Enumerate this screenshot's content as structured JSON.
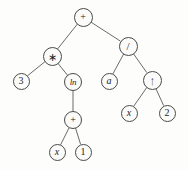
{
  "figure": {
    "kind": "expression-tree",
    "expression": "3 * ln(x + 1) + a / x ^ 2",
    "width": 188,
    "height": 170,
    "background_color": "#fdfdfc",
    "node_stroke_color": "#4a4a4a",
    "node_fill_color": "#fbfbfa",
    "edge_color": "#5a5a5a",
    "text_color": "#1d1d1d"
  },
  "nodes": [
    {
      "id": "n0",
      "label": "+",
      "kind": "operator",
      "role": "root",
      "cx": 83,
      "cy": 17,
      "r": 9.5,
      "font_size": 10
    },
    {
      "id": "n1",
      "label": "∗",
      "kind": "operator",
      "role": "multiply",
      "cx": 52,
      "cy": 56,
      "r": 9.5,
      "font_size": 11
    },
    {
      "id": "n2",
      "label": "/",
      "kind": "operator",
      "role": "divide",
      "cx": 128,
      "cy": 46,
      "r": 9.5,
      "font_size": 11
    },
    {
      "id": "n3",
      "label": "3",
      "kind": "number",
      "role": "leaf",
      "cx": 21,
      "cy": 81,
      "r": 8.5,
      "font_size": 10
    },
    {
      "id": "n4",
      "label": "ln",
      "kind": "function",
      "role": "natural-log",
      "cx": 73,
      "cy": 82,
      "r": 9.0,
      "font_size": 9
    },
    {
      "id": "n5",
      "label": "a",
      "kind": "variable",
      "role": "leaf",
      "cx": 109,
      "cy": 81,
      "r": 8.5,
      "font_size": 10
    },
    {
      "id": "n6",
      "label": "↑",
      "kind": "operator",
      "role": "power",
      "cx": 152,
      "cy": 80,
      "r": 9.5,
      "font_size": 13
    },
    {
      "id": "n7",
      "label": "+",
      "kind": "operator",
      "role": "add",
      "cx": 73,
      "cy": 120,
      "r": 9.0,
      "font_size": 10
    },
    {
      "id": "n8",
      "label": "x",
      "kind": "variable",
      "role": "leaf",
      "cx": 129,
      "cy": 113,
      "r": 8.5,
      "font_size": 10
    },
    {
      "id": "n9",
      "label": "2",
      "kind": "number",
      "role": "leaf",
      "cx": 167,
      "cy": 113,
      "r": 8.5,
      "font_size": 10
    },
    {
      "id": "n10",
      "label": "x",
      "kind": "variable",
      "role": "leaf",
      "cx": 57,
      "cy": 152,
      "r": 8.5,
      "font_size": 10
    },
    {
      "id": "n11",
      "label": "1",
      "kind": "number",
      "role": "leaf",
      "cx": 83,
      "cy": 152,
      "r": 8.5,
      "font_size": 10
    }
  ],
  "edges": [
    {
      "from": "n0",
      "to": "n1",
      "name": "edge-root-to-multiply"
    },
    {
      "from": "n0",
      "to": "n2",
      "name": "edge-root-to-divide"
    },
    {
      "from": "n1",
      "to": "n3",
      "name": "edge-multiply-to-three"
    },
    {
      "from": "n1",
      "to": "n4",
      "name": "edge-multiply-to-ln"
    },
    {
      "from": "n4",
      "to": "n7",
      "name": "edge-ln-to-add"
    },
    {
      "from": "n7",
      "to": "n10",
      "name": "edge-add-to-x"
    },
    {
      "from": "n7",
      "to": "n11",
      "name": "edge-add-to-one"
    },
    {
      "from": "n2",
      "to": "n5",
      "name": "edge-divide-to-a"
    },
    {
      "from": "n2",
      "to": "n6",
      "name": "edge-divide-to-power"
    },
    {
      "from": "n6",
      "to": "n8",
      "name": "edge-power-to-x"
    },
    {
      "from": "n6",
      "to": "n9",
      "name": "edge-power-to-two"
    }
  ]
}
